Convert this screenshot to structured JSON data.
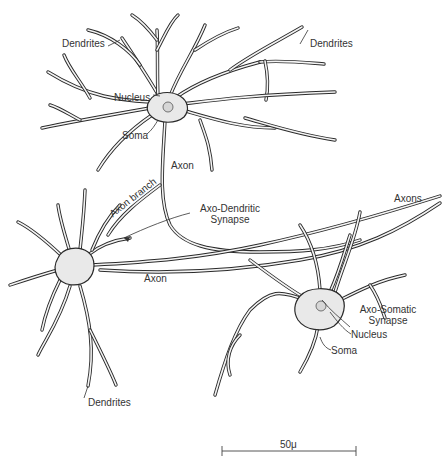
{
  "diagram": {
    "labels": {
      "dendrites_top_left": "Dendrites",
      "dendrites_top_right": "Dendrites",
      "nucleus_top": "Nucleus",
      "soma_top": "Soma",
      "axon_top": "Axon",
      "axon_branch": "Axon branch",
      "axo_dendritic_line1": "Axo-Dendritic",
      "axo_dendritic_line2": "Synapse",
      "axons_right": "Axons",
      "axon_middle": "Axon",
      "axo_somatic_line1": "Axo-Somatic",
      "axo_somatic_line2": "Synapse",
      "nucleus_bottom": "Nucleus",
      "soma_bottom": "Soma",
      "dendrites_bottom": "Dendrites"
    },
    "scale_bar": {
      "label": "50μ"
    },
    "neurons": [
      {
        "name": "upper neuron",
        "parts": [
          "soma",
          "nucleus",
          "dendrites",
          "axon"
        ]
      },
      {
        "name": "left neuron",
        "parts": [
          "soma",
          "dendrites",
          "axon"
        ]
      },
      {
        "name": "lower-right neuron",
        "parts": [
          "soma",
          "nucleus",
          "dendrites"
        ]
      }
    ]
  }
}
